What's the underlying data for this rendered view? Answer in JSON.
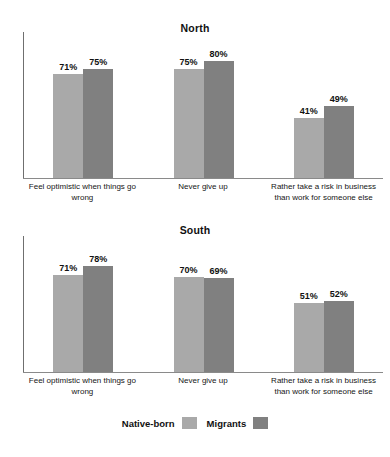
{
  "chart_data": [
    {
      "type": "bar",
      "title": "North",
      "xlabel": "",
      "ylabel": "",
      "ylim": [
        0,
        100
      ],
      "grid": false,
      "legend_position": "bottom",
      "categories": [
        "Feel optimistic when things go wrong",
        "Never give up",
        "Rather take a risk in business than work for someone else"
      ],
      "series": [
        {
          "name": "Native-born",
          "color": "#a9a9a9",
          "values": [
            71,
            75,
            41
          ],
          "labels": [
            "71%",
            "75%",
            "41%"
          ]
        },
        {
          "name": "Migrants",
          "color": "#808080",
          "values": [
            75,
            80,
            49
          ],
          "labels": [
            "75%",
            "80%",
            "49%"
          ]
        }
      ]
    },
    {
      "type": "bar",
      "title": "South",
      "xlabel": "",
      "ylabel": "",
      "ylim": [
        0,
        100
      ],
      "grid": false,
      "legend_position": "bottom",
      "categories": [
        "Feel optimistic when things go wrong",
        "Never give up",
        "Rather take a risk in business than work for someone else"
      ],
      "series": [
        {
          "name": "Native-born",
          "color": "#a9a9a9",
          "values": [
            71,
            70,
            51
          ],
          "labels": [
            "71%",
            "70%",
            "51%"
          ]
        },
        {
          "name": "Migrants",
          "color": "#808080",
          "values": [
            78,
            69,
            52
          ],
          "labels": [
            "78%",
            "69%",
            "52%"
          ]
        }
      ]
    }
  ],
  "legend": {
    "items": [
      {
        "label": "Native-born",
        "color": "#a9a9a9"
      },
      {
        "label": "Migrants",
        "color": "#808080"
      }
    ]
  }
}
